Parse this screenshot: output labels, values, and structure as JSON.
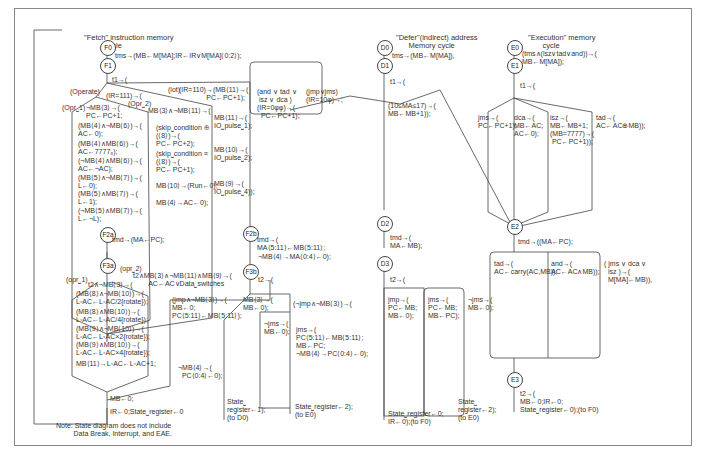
{
  "diagram": {
    "fetch": {
      "title": "\"Fetch\" instruction memory\n          cycle",
      "nodes": {
        "F0": "F0",
        "F1": "F1",
        "F2a": "F2a",
        "F2b": "F2b",
        "F3a": "F3a",
        "F3b": "F3b"
      },
      "t_ms": "tms→(MB←M[MA];IR←IR∨M[MA]⟨0:2⟩);",
      "t1": "t1→(",
      "operate": "(Operate)",
      "ir111": "(IR=111)→(",
      "iot": "(iot)",
      "ir110": "(IR=110)→(MB⟨11⟩→(\n              PC←PC+1);",
      "opr1": "(Opr⎵1)",
      "opr2": "(Opr⎵2)",
      "mb3": "¬MB⟨3⟩→(\nPC←PC+1;",
      "mb3_11": "MB⟨3⟩∧¬MB⟨11⟩→(",
      "opr1_items": [
        "(MB⟨4⟩∧¬MB⟨6⟩)→(\nAC←0);",
        "(MB⟨4⟩∧MB⟨6⟩)→(\nAC←7777₈);",
        "(¬MB⟨4⟩∧MB⟨6⟩)→(\nAC←¬AC);",
        "(MB⟨5⟩∧¬MB⟨7⟩)→(\nL←0);",
        "(MB⟨5⟩∧MB⟨7⟩)→(\nL←1);",
        "(¬MB⟨5⟩∧MB⟨7⟩)→(\nL←¬L);"
      ],
      "opr2_items": [
        "(skip⎵condition ⊕\n(⟨8⟩)→(\nPC←PC+2);",
        "(skip⎵condition ≡\n(⟨8⟩)→(\nPC←PC+1);",
        "MB⟨10⟩→(Run←0);",
        "MB⟨4⟩→AC←0);"
      ],
      "iot_items": [
        "MB⟨11⟩→(\nIO⎵pulse⎵1);",
        "MB⟨10⟩→(\nIO⎵pulse⎵2);",
        "MB⟨9⟩→(\nIO⎵pulse⎵4));"
      ],
      "and_tad": "(and ∨ tad ∨\n isz ∨ dca )\n(IR=0φφ)→(\n  PC←PC+1);",
      "jmp_jms": "(jmp∨jms)\n(IR=10φ)→;",
      "tmd_f2a": "tmd→(MA←PC);",
      "f2b": "tmd→(\nMA⟨5:11⟩←MB⟨5:11⟩;",
      "f2b_neg": "¬MB⟨4⟩→MA⟨0:4⟩←0);",
      "opr1b": "(opr⎵1)",
      "opr2b": "(opr⎵2)",
      "t2_opr2": "t2∧MB⟨3⟩∧¬MB⟨11⟩∧MB⟨9⟩→(\n        AC←AC∨Data⎵switches",
      "t2_mb3": "t2∧¬MB⟨3⟩→(",
      "rotate_items": [
        "(MB⟨8⟩∧¬MB⟨10⟩)→(\nL◦AC←L◦AC/2{rotate});",
        "(MB⟨8⟩∧MB⟨10⟩)→(\nL◦AC←L◦AC/4{rotate});",
        "(MB⟨9⟩∧¬MB⟨10⟩)→(\nL◦AC←L◦AC×2{rotate});",
        "(MB⟨9⟩∧MB⟨10⟩)→(\nL◦AC←L◦AC×4{rotate});",
        "MB⟨11⟩→L◦AC←L◦AC+1;"
      ],
      "mb0": "MB←0;",
      "ir0": "IR←0;State⎵register←0",
      "t2_f3b": "t2→(",
      "jmp_mb3": "(jmp∧¬MB⟨3⟩)→(\nMB←0;\nPC⟨5:11⟩←MB⟨5:11⟩);",
      "mb4_pc": "¬MB⟨4⟩→(\n  PC⟨0:4⟩←0);",
      "mb3_mb0": "MB⟨3⟩→(\nMB←0);",
      "njmp": "(¬jmp∧¬MB⟨3⟩)→(",
      "njms": "¬jms→(\nMB←0);",
      "jms": "jms→(\nPC⟨5:11⟩←MB⟨5:11⟩;\nMB←PC;\n¬MB⟨4⟩→PC⟨0:4⟩←0);",
      "state1": "State⎵\nregister←1);\n(to D0)",
      "state2": "State⎵register←2);\n(to E0)"
    },
    "defer": {
      "title": "\"Defer\"(indirect) address\n      Memory cycle",
      "nodes": {
        "D0": "D0",
        "D1": "D1",
        "D2": "D2",
        "D3": "D3"
      },
      "tms": "tms→(MB←M[MA]),",
      "t1": "t1→(",
      "autoinc": "(10≤MA≤17)→(\nMB←MB+1));",
      "tmd": "tmd→(\nMA←MB);",
      "t2": "t2→(",
      "jmp": "jmp→(\nPC←MB;\nMB←0);",
      "jms": "jms→(\nPC←MB;\nMB←PC);",
      "njms": "¬jms→(\nMB←0);",
      "state0": "State⎵register←0;\nIR←0);(to F0)",
      "state2": "State⎵\nregister←2);\n(to E0)"
    },
    "execute": {
      "title": "\"Execution\" memory\n       cycle",
      "nodes": {
        "E0": "E0",
        "E1": "E1",
        "E2": "E2",
        "E3": "E3"
      },
      "tms": "(tms∧(isz∨tad∨and))→(\nMB←M[MA]);",
      "t1": "t1→(",
      "jms": "jms→(\nPC←PC+1);",
      "dca": "dca→(\nMB←AC;\nAC←0);",
      "isz": "isz→(\nMB←MB+1;\n(MB=7777)→(\n PC←PC+1));",
      "tad": "tad→(\nAC←AC⊕MB));",
      "tmd": "tmd→((MA←PC);",
      "tad2": "tad→(\nAC←carry(AC,MB));",
      "and2": "and→(\nAC←AC∧MB));",
      "jms_dca_isz": "( jms ∨ dca ∨\n  isz )→(\n  M[MA]←MB)),",
      "t2": "t2→(\nMB←0;IR←0;\nState⎵register←0);(to F0)"
    },
    "note": "Note: State diagram does not include\n         Data Break, Interrupt, and EAE."
  }
}
